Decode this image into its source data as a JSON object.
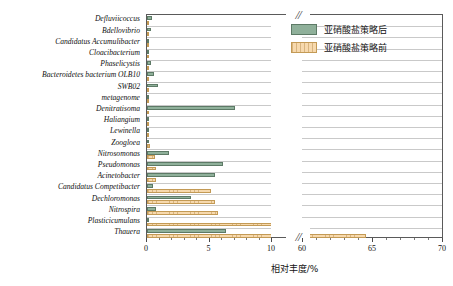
{
  "chart_data": {
    "type": "bar",
    "orientation": "horizontal",
    "title": "",
    "xlabel": "相对丰度/%",
    "ylabel": "",
    "grid": true,
    "legend_position": "top-right",
    "axis_break": {
      "present": true,
      "marker": "//",
      "segment1": [
        0,
        10
      ],
      "segment2": [
        60,
        70
      ]
    },
    "xlim": [
      0,
      70
    ],
    "xticks": [
      0,
      5,
      10,
      60,
      65,
      70
    ],
    "xticklabels": [
      "0",
      "5",
      "10",
      "60",
      "65",
      "70"
    ],
    "categories": [
      "Defluviicoccus",
      "Bdellovibrio",
      "Candidatus Accumulibacter",
      "Cloacibacterium",
      "Phaselicystis",
      "Bacteroidetes bacterium OLB10",
      "SWB02",
      "metagenome",
      "Denitratisoma",
      "Haliangium",
      "Lewinella",
      "Zoogloea",
      "Nitrosomonas",
      "Pseudomonas",
      "Acinetobacter",
      "Candidatus Competibacter",
      "Dechloromonas",
      "Nitrospira",
      "Plasticicumulans",
      "Thauera"
    ],
    "series": [
      {
        "name": "亚硝酸盐策略后",
        "color": "#8fb09a",
        "values": [
          0.4,
          0.3,
          0.05,
          0.05,
          0.35,
          0.55,
          0.85,
          0.12,
          7.0,
          0.1,
          0.08,
          0.06,
          1.75,
          6.05,
          5.45,
          0.45,
          3.55,
          0.7,
          0.1,
          6.35
        ]
      },
      {
        "name": "亚硝酸盐策略前",
        "color": "#f7d9ad",
        "values": [
          0.05,
          0.05,
          0.05,
          0.05,
          0.05,
          0.05,
          0.05,
          0.1,
          0.1,
          0.12,
          0.1,
          0.2,
          0.65,
          0.7,
          0.7,
          5.1,
          5.4,
          5.7,
          10.9,
          64.5
        ]
      }
    ]
  },
  "legend": {
    "items": [
      {
        "label": "亚硝酸盐策略后",
        "series": "after"
      },
      {
        "label": "亚硝酸盐策略前",
        "series": "before"
      }
    ]
  },
  "axis": {
    "x_title": "相对丰度/%",
    "tick_labels": [
      "0",
      "5",
      "10",
      "60",
      "65",
      "70"
    ],
    "break_marker": "//"
  }
}
